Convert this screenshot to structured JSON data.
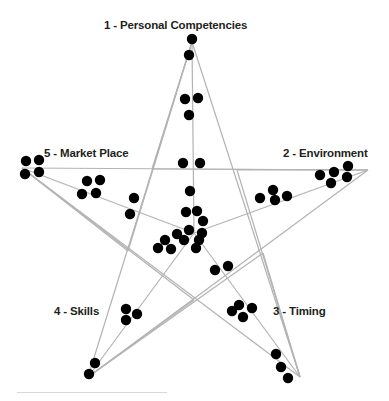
{
  "figure": {
    "width": 389,
    "height": 401,
    "background_color": "#ffffff",
    "line_color": "#b3b3b3",
    "dot_color": "#000000",
    "label_color": "#231f20"
  },
  "axes": [
    {
      "id": "top",
      "number": "1",
      "name": "Personal Competencies",
      "label": "1 - Personal Competencies"
    },
    {
      "id": "right",
      "number": "2",
      "name": "Environment",
      "label": "2 - Environment"
    },
    {
      "id": "bottomright",
      "number": "3",
      "name": "Timing",
      "label": "3 - Timing"
    },
    {
      "id": "bottomleft",
      "number": "4",
      "name": "Skills",
      "label": "4 - Skills"
    },
    {
      "id": "left",
      "number": "5",
      "name": "Market Place",
      "label": "5 - Market Place"
    }
  ],
  "chart_data": {
    "type": "scatter",
    "title": "",
    "xlabel": "",
    "ylabel": "",
    "grid": false,
    "legend": "none",
    "xlim": [
      0,
      389
    ],
    "ylim": [
      0,
      401
    ],
    "center": {
      "x": 194,
      "y": 233
    },
    "star_points": [
      {
        "axis": "top",
        "x": 192,
        "y": 42
      },
      {
        "axis": "right",
        "x": 368,
        "y": 170
      },
      {
        "axis": "bottomright",
        "x": 300,
        "y": 377
      },
      {
        "axis": "bottomleft",
        "x": 88,
        "y": 377
      },
      {
        "axis": "left",
        "x": 22,
        "y": 168
      }
    ],
    "inner_points": [
      {
        "x": 152,
        "y": 169
      },
      {
        "x": 237,
        "y": 170
      },
      {
        "x": 263,
        "y": 253
      },
      {
        "x": 194,
        "y": 300
      },
      {
        "x": 128,
        "y": 251
      }
    ],
    "dot_radius": 5.2,
    "series": [
      {
        "name": "1 - Personal Competencies",
        "axis": "top",
        "count": 5,
        "points": [
          {
            "x": 192,
            "y": 39
          },
          {
            "x": 189,
            "y": 55
          },
          {
            "x": 185,
            "y": 99
          },
          {
            "x": 198,
            "y": 98
          },
          {
            "x": 189,
            "y": 115
          }
        ]
      },
      {
        "name": "2 - Environment",
        "axis": "right",
        "count": 9,
        "points": [
          {
            "x": 348,
            "y": 166
          },
          {
            "x": 334,
            "y": 172
          },
          {
            "x": 320,
            "y": 175
          },
          {
            "x": 331,
            "y": 183
          },
          {
            "x": 347,
            "y": 177
          },
          {
            "x": 273,
            "y": 190
          },
          {
            "x": 260,
            "y": 198
          },
          {
            "x": 275,
            "y": 200
          },
          {
            "x": 287,
            "y": 196
          }
        ]
      },
      {
        "name": "3 - Timing",
        "axis": "bottomright",
        "count": 9,
        "points": [
          {
            "x": 276,
            "y": 354
          },
          {
            "x": 281,
            "y": 367
          },
          {
            "x": 288,
            "y": 378
          },
          {
            "x": 239,
            "y": 305
          },
          {
            "x": 252,
            "y": 308
          },
          {
            "x": 243,
            "y": 317
          },
          {
            "x": 232,
            "y": 311
          },
          {
            "x": 215,
            "y": 270
          },
          {
            "x": 228,
            "y": 266
          }
        ]
      },
      {
        "name": "4 - Skills",
        "axis": "bottomleft",
        "count": 5,
        "points": [
          {
            "x": 95,
            "y": 363
          },
          {
            "x": 89,
            "y": 374
          },
          {
            "x": 126,
            "y": 309
          },
          {
            "x": 137,
            "y": 314
          },
          {
            "x": 126,
            "y": 320
          }
        ]
      },
      {
        "name": "5 - Market Place",
        "axis": "left",
        "count": 8,
        "points": [
          {
            "x": 26,
            "y": 161
          },
          {
            "x": 39,
            "y": 160
          },
          {
            "x": 25,
            "y": 174
          },
          {
            "x": 39,
            "y": 172
          },
          {
            "x": 87,
            "y": 181
          },
          {
            "x": 100,
            "y": 180
          },
          {
            "x": 82,
            "y": 194
          },
          {
            "x": 96,
            "y": 193
          }
        ]
      },
      {
        "name": "Center cluster",
        "axis": "center",
        "count": 17,
        "points": [
          {
            "x": 183,
            "y": 163
          },
          {
            "x": 200,
            "y": 163
          },
          {
            "x": 190,
            "y": 191
          },
          {
            "x": 134,
            "y": 198
          },
          {
            "x": 130,
            "y": 214
          },
          {
            "x": 186,
            "y": 212
          },
          {
            "x": 197,
            "y": 211
          },
          {
            "x": 203,
            "y": 221
          },
          {
            "x": 189,
            "y": 230
          },
          {
            "x": 202,
            "y": 233
          },
          {
            "x": 177,
            "y": 234
          },
          {
            "x": 165,
            "y": 240
          },
          {
            "x": 184,
            "y": 240
          },
          {
            "x": 199,
            "y": 240
          },
          {
            "x": 158,
            "y": 248
          },
          {
            "x": 171,
            "y": 249
          },
          {
            "x": 196,
            "y": 248
          }
        ]
      }
    ]
  }
}
